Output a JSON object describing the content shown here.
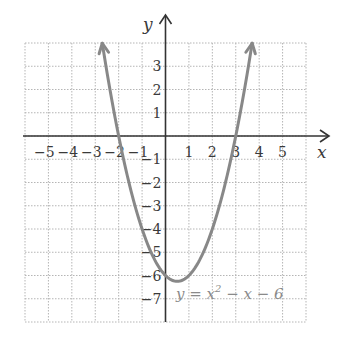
{
  "chart_data": {
    "type": "line",
    "title": "",
    "xlabel": "x",
    "ylabel": "y",
    "xlim": [
      -6,
      6
    ],
    "ylim": [
      -8,
      4
    ],
    "grid": true,
    "grid_style": "dotted",
    "x_ticks": [
      -5,
      -4,
      -3,
      -2,
      -1,
      1,
      2,
      3,
      4,
      5
    ],
    "y_ticks": [
      3,
      2,
      1,
      -1,
      -2,
      -3,
      -4,
      -5,
      -6,
      -7
    ],
    "x_tick_labels": [
      "−5",
      "−4",
      "−3",
      "−2",
      "−1",
      "1",
      "2",
      "3",
      "4",
      "5"
    ],
    "y_tick_labels": [
      "3",
      "2",
      "1",
      "−1",
      "−2",
      "−3",
      "−4",
      "−5",
      "−6",
      "−7"
    ],
    "series": [
      {
        "name": "y = x^2 - x - 6",
        "function": "x^2 - x - 6",
        "x_range": [
          -2.7,
          3.7
        ],
        "points": [
          {
            "x": -2.7,
            "y": 4.0
          },
          {
            "x": -2,
            "y": 0
          },
          {
            "x": -1,
            "y": -4
          },
          {
            "x": 0,
            "y": -6
          },
          {
            "x": 0.5,
            "y": -6.25
          },
          {
            "x": 1,
            "y": -6
          },
          {
            "x": 2,
            "y": -4
          },
          {
            "x": 3,
            "y": 0
          },
          {
            "x": 3.7,
            "y": 4.0
          }
        ],
        "vertex": {
          "x": 0.5,
          "y": -6.25
        },
        "x_intercepts": [
          -2,
          3
        ],
        "y_intercept": -6,
        "arrows_at_ends": true,
        "color": "#888888"
      }
    ],
    "annotations": [
      {
        "text": "y = x² − x − 6",
        "x": 0.5,
        "y": -6.9
      }
    ]
  },
  "labels": {
    "x_axis": "x",
    "y_axis": "y",
    "equation_main": "y = x",
    "equation_sup": "2",
    "equation_tail": " − x − 6"
  },
  "colors": {
    "curve": "#888888",
    "axes": "#333333",
    "grid": "#b5b5b5"
  }
}
